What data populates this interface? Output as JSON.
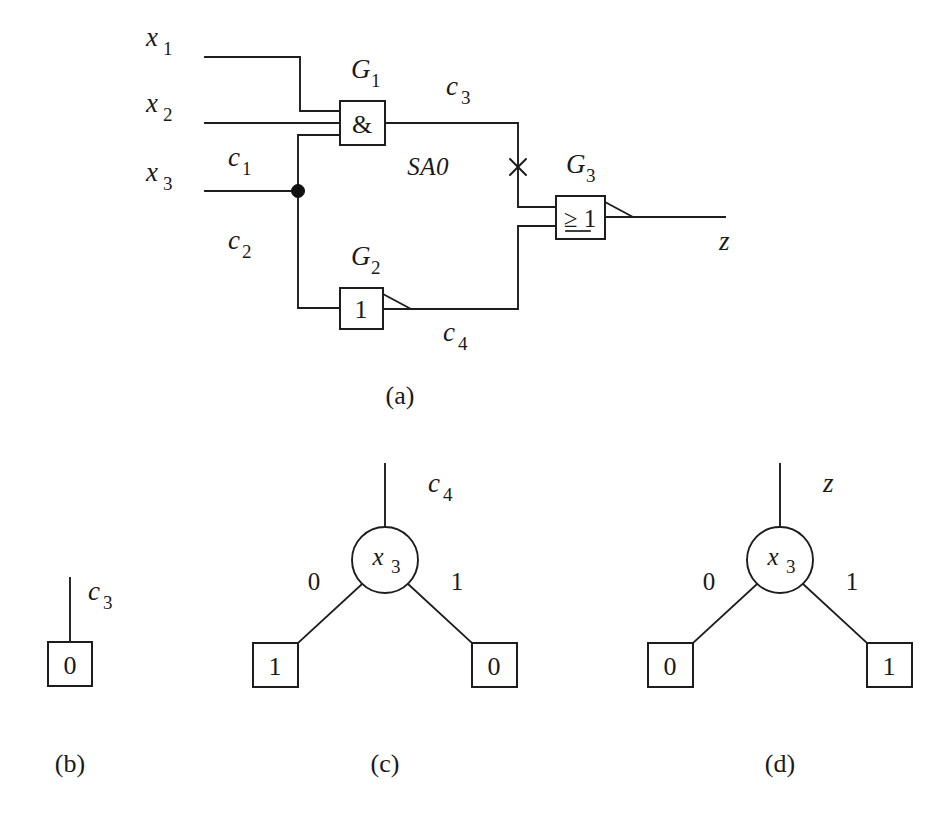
{
  "figure": {
    "captions": {
      "a": "(a)",
      "b": "(b)",
      "c": "(c)",
      "d": "(d)"
    }
  },
  "circuit": {
    "inputs": [
      {
        "name": "x1",
        "base": "x",
        "sub": "1"
      },
      {
        "name": "x2",
        "base": "x",
        "sub": "2"
      },
      {
        "name": "x3",
        "base": "x",
        "sub": "3"
      }
    ],
    "gates": [
      {
        "id": "G1",
        "base": "G",
        "sub": "1",
        "symbol": "&",
        "type": "and"
      },
      {
        "id": "G2",
        "base": "G",
        "sub": "2",
        "symbol": "1",
        "type": "inverter"
      },
      {
        "id": "G3",
        "base": "G",
        "sub": "3",
        "symbol": "≥ 1",
        "type": "nor"
      }
    ],
    "nets": [
      {
        "name": "c1",
        "base": "c",
        "sub": "1"
      },
      {
        "name": "c2",
        "base": "c",
        "sub": "2"
      },
      {
        "name": "c3",
        "base": "c",
        "sub": "3"
      },
      {
        "name": "c4",
        "base": "c",
        "sub": "4"
      }
    ],
    "output": {
      "name": "z",
      "base": "z",
      "sub": ""
    },
    "fault": {
      "label": "SA0",
      "marker": "x-cross"
    }
  },
  "bdd_b": {
    "net_label": {
      "base": "c",
      "sub": "3"
    },
    "terminal": "0"
  },
  "bdd_c": {
    "net_label": {
      "base": "c",
      "sub": "4"
    },
    "root": {
      "base": "x",
      "sub": "3"
    },
    "edges": [
      {
        "label": "0",
        "side": "left"
      },
      {
        "label": "1",
        "side": "right"
      }
    ],
    "terminals": [
      {
        "label": "1",
        "side": "left"
      },
      {
        "label": "0",
        "side": "right"
      }
    ]
  },
  "bdd_d": {
    "net_label": {
      "base": "z",
      "sub": ""
    },
    "root": {
      "base": "x",
      "sub": "3"
    },
    "edges": [
      {
        "label": "0",
        "side": "left"
      },
      {
        "label": "1",
        "side": "right"
      }
    ],
    "terminals": [
      {
        "label": "0",
        "side": "left"
      },
      {
        "label": "1",
        "side": "right"
      }
    ]
  },
  "colors": {
    "ink": "#1d1d1d",
    "paper": "#ffffff"
  }
}
